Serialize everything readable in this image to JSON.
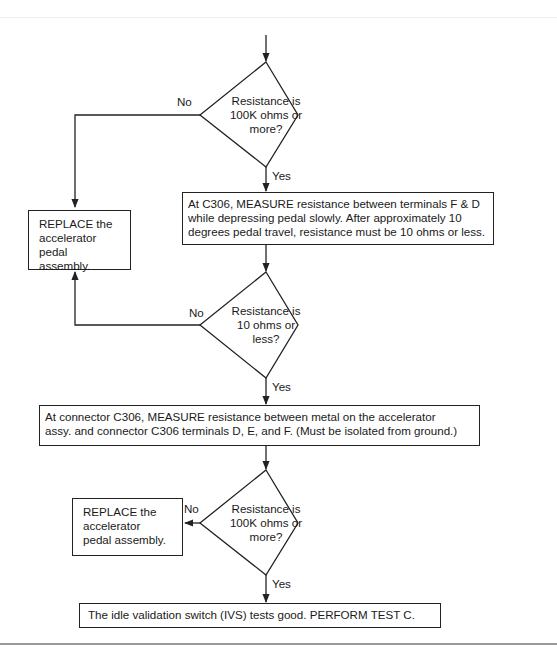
{
  "diagram": {
    "type": "flowchart",
    "decisions": [
      {
        "id": "d1",
        "lines": [
          "Resistance is",
          "100K ohms or",
          "more?"
        ],
        "no_label": "No",
        "yes_label": "Yes"
      },
      {
        "id": "d2",
        "lines": [
          "Resistance is",
          "10 ohms or",
          "less?"
        ],
        "no_label": "No",
        "yes_label": "Yes"
      },
      {
        "id": "d3",
        "lines": [
          "Resistance is",
          "100K ohms or",
          "more?"
        ],
        "no_label": "No",
        "yes_label": "Yes"
      }
    ],
    "steps": {
      "measure_fd": {
        "lines": [
          "At C306, MEASURE resistance between terminals F & D",
          "while depressing pedal slowly. After approximately 10",
          "degrees pedal travel, resistance must be 10 ohms or less."
        ]
      },
      "measure_ground": {
        "lines": [
          "At connector C306, MEASURE resistance between metal on the accelerator",
          "assy. and connector C306 terminals D, E, and F. (Must be isolated from ground.)"
        ]
      },
      "replace_1": {
        "lines": [
          "REPLACE the",
          "accelerator",
          "pedal assembly."
        ]
      },
      "replace_2": {
        "lines": [
          "REPLACE the",
          "accelerator",
          "pedal assembly."
        ]
      },
      "final": {
        "lines": [
          "The idle validation switch (IVS) tests good. PERFORM TEST C."
        ]
      }
    },
    "colors": {
      "line": "#222222",
      "background": "#ffffff"
    }
  }
}
